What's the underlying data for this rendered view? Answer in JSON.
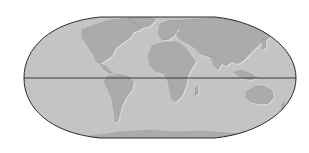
{
  "map": {
    "projection": "flat-polar pseudo-cylindrical world map",
    "colors": {
      "background": "#ffffff",
      "ocean": "#c4c4c4",
      "land": "#a9a9a9",
      "outline": "#2a2a2a",
      "equator": "#2a2a2a",
      "coast_highlight": "#e2e2e2"
    },
    "features": {
      "equator_line": true,
      "graticule": false,
      "labels": []
    }
  }
}
